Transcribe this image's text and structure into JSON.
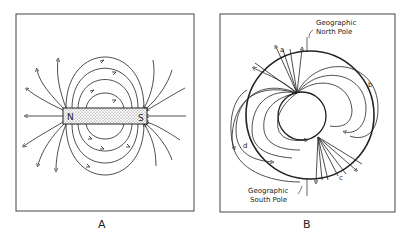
{
  "figure": {
    "panels": [
      {
        "id": "A",
        "caption": "A",
        "description": "Bar magnet field lines",
        "magnet": {
          "north_label": "N",
          "south_label": "S"
        }
      },
      {
        "id": "B",
        "caption": "B",
        "description": "Earth's magnetic field",
        "labels": {
          "north": [
            "Geographic",
            "North Pole"
          ],
          "south": [
            "Geographic",
            "South Pole"
          ],
          "points": [
            "a",
            "b",
            "c",
            "d"
          ]
        }
      }
    ]
  },
  "colors": {
    "line": "#222222",
    "frame": "#444444",
    "background": "#ffffff"
  }
}
